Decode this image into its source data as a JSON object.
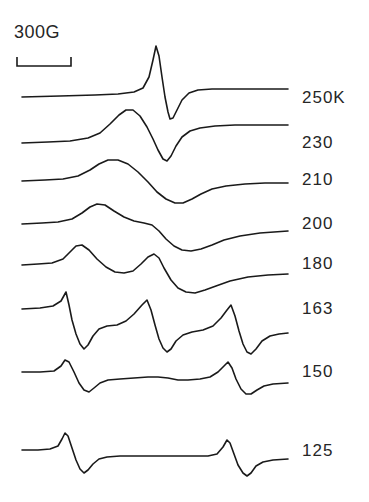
{
  "figure": {
    "kind": "epr-derivative-spectra-stack",
    "width": 369,
    "height": 502,
    "background_color": "#ffffff",
    "ink_color": "#1a1a1a"
  },
  "scale_bar": {
    "caption": "300G",
    "caption_x": 14,
    "caption_y": 22,
    "bar_x_start": 17,
    "bar_x_end": 71,
    "bar_y": 66,
    "tick_height": 9
  },
  "chart_data": {
    "type": "line",
    "title": "",
    "xlabel": "",
    "ylabel": "",
    "legend_position": "right",
    "grid": false,
    "x_axis": {
      "unit": "G",
      "scale_bar_gauss": 300,
      "scale_bar_pixels": 54,
      "sweep_pixel_start": 22,
      "sweep_pixel_end": 288
    },
    "series": [
      {
        "name": "250 K",
        "label": "250K",
        "label_x": 302,
        "label_y": 88,
        "baseline_y": 96,
        "peak_x": [
          155
        ],
        "trough_x": [
          172
        ],
        "path": "M22,97 L60,96 L95,95 L118,94 L134,92 L143,88 L149,77 L153,60 L156,46 L159,56 L162,77 L165,97 L168,112 L170,119 L173,118 L177,110 L182,100 L189,93 L198,90 L212,89 L235,89 L260,89 L288,89"
      },
      {
        "name": "230 K",
        "label": "230",
        "label_x": 302,
        "label_y": 133,
        "baseline_y": 141,
        "peak_x": [
          126
        ],
        "trough_x": [
          166
        ],
        "path": "M22,143 L48,142 L70,141 L88,138 L100,133 L110,124 L119,115 L126,110 L133,110 L140,116 L147,127 L153,139 L158,150 L163,159 L167,161 L171,156 L176,146 L182,137 L190,131 L200,128 L215,126 L235,125 L258,125 L288,125"
      },
      {
        "name": "210 K",
        "label": "210",
        "label_x": 302,
        "label_y": 170,
        "baseline_y": 178,
        "peak_x": [
          108
        ],
        "trough_x": [
          178
        ],
        "path": "M22,181 L45,180 L63,179 L78,176 L90,170 L99,164 L108,160 L118,160 L128,164 L138,172 L148,182 L157,192 L166,199 L175,203 L183,203 L192,199 L201,194 L212,189 L226,186 L245,184 L265,183 L288,183"
      },
      {
        "name": "200 K",
        "label": "200",
        "label_x": 302,
        "label_y": 214,
        "baseline_y": 222,
        "peak_x": [
          95
        ],
        "trough_x": [
          188
        ],
        "path": "M22,224 L42,223 L58,222 L72,219 L82,213 L90,207 L97,204 L105,205 L114,211 L124,217 L134,221 L144,223 L152,225 L159,231 L166,239 L174,246 L182,250 L191,251 L201,249 L212,245 L224,240 L240,236 L260,233 L288,231"
      },
      {
        "name": "180 K",
        "label": "180",
        "label_x": 302,
        "label_y": 254,
        "baseline_y": 262,
        "peak_x": [
          78,
          150
        ],
        "trough_x": [
          118,
          196
        ],
        "path": "M22,265 L38,264 L52,263 L63,259 L70,252 L76,246 L82,245 L89,250 L97,259 L106,267 L115,272 L124,273 L133,271 L141,264 L148,257 L154,254 L159,258 L164,268 L171,280 L178,288 L186,292 L195,293 L205,290 L216,286 L230,281 L248,277 L268,275 L288,274"
      },
      {
        "name": "163 K",
        "label": "163",
        "label_x": 302,
        "label_y": 299,
        "baseline_y": 307,
        "peak_x": [
          68,
          148,
          228
        ],
        "trough_x": [
          85,
          165,
          245
        ],
        "path": "M22,309 L40,308 L53,306 L61,301 L66,292 L69,305 L72,320 L76,334 L80,344 L84,349 L88,345 L93,336 L99,329 L107,326 L117,325 L126,321 L134,314 L142,305 L147,300 L151,310 L155,325 L159,339 L163,348 L167,352 L171,349 L176,341 L183,335 L192,332 L203,330 L213,326 L221,318 L227,310 L231,305 L235,316 L239,331 L243,344 L247,352 L251,354 L256,349 L262,341 L270,336 L279,334 L288,333"
      },
      {
        "name": "150 K",
        "label": "150",
        "label_x": 302,
        "label_y": 362,
        "baseline_y": 370,
        "peak_x": [
          65,
          225
        ],
        "trough_x": [
          85,
          245
        ],
        "path": "M22,372 L40,372 L54,371 L61,366 L65,360 L69,362 L74,372 L79,383 L84,390 L89,392 L94,388 L100,383 L108,380 L120,379 L134,378 L148,377 L158,377 L168,378 L178,380 L188,380 L200,379 L210,377 L218,372 L224,366 L228,362 L232,368 L236,379 L241,389 L246,394 L251,394 L257,390 L264,386 L273,384 L288,383"
      },
      {
        "name": "125 K",
        "label": "125",
        "label_x": 302,
        "label_y": 441,
        "baseline_y": 449,
        "peak_x": [
          65,
          227
        ],
        "trough_x": [
          83,
          245
        ],
        "path": "M22,450 L38,450 L50,449 L58,446 L62,439 L65,433 L68,436 L72,448 L76,460 L80,469 L84,473 L88,470 L93,464 L99,459 L107,457 L120,456 L140,456 L165,456 L190,456 L208,456 L217,454 L223,447 L227,440 L230,443 L234,454 L238,465 L243,473 L247,476 L251,473 L256,466 L263,462 L273,460 L288,459"
      }
    ]
  }
}
